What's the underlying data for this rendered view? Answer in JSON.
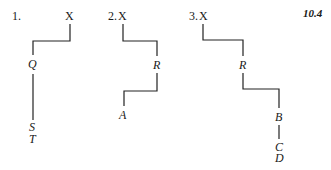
{
  "figure_label": "10.4",
  "diagrams": [
    {
      "number": "1.",
      "root": "X",
      "nodes": [
        "Q",
        "S",
        "T"
      ]
    },
    {
      "number": "2.",
      "root": "X",
      "nodes": [
        "R",
        "A"
      ]
    },
    {
      "number": "3.",
      "root": "X",
      "nodes": [
        "R",
        "B",
        "C",
        "D"
      ]
    }
  ]
}
